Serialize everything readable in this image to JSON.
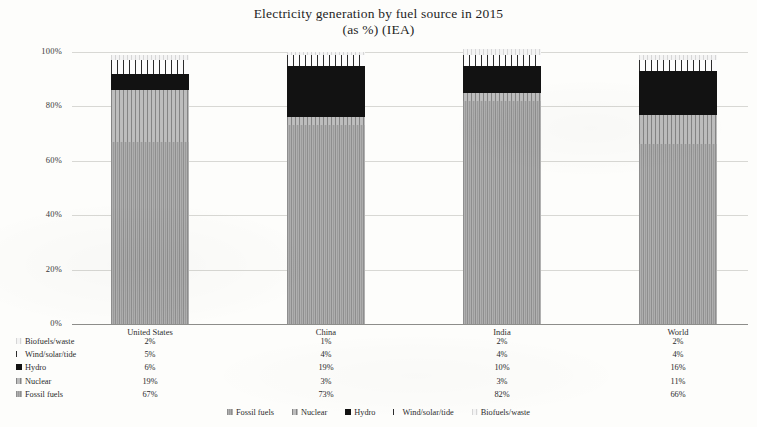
{
  "title": {
    "line1": "Electricity generation by fuel source in 2015",
    "line2": "(as %) (IEA)"
  },
  "chart_data": {
    "type": "bar",
    "subtype": "stacked-percentage-column",
    "title": "Electricity generation by fuel source in 2015 (as %) (IEA)",
    "xlabel": "",
    "ylabel": "",
    "ylim": [
      0,
      100
    ],
    "yticks": [
      "0%",
      "20%",
      "40%",
      "60%",
      "80%",
      "100%"
    ],
    "ytick_values": [
      0,
      20,
      40,
      60,
      80,
      100
    ],
    "grid": true,
    "legend_position": "bottom",
    "categories": [
      "United States",
      "China",
      "India",
      "World"
    ],
    "series": [
      {
        "name": "Fossil fuels",
        "values": [
          67,
          73,
          82,
          66
        ],
        "color": "#a3a3a3",
        "pattern": "noise"
      },
      {
        "name": "Nuclear",
        "values": [
          19,
          3,
          3,
          11
        ],
        "color": "#b5b5b5",
        "pattern": "vlines-gray"
      },
      {
        "name": "Hydro",
        "values": [
          6,
          19,
          10,
          16
        ],
        "color": "#111111",
        "pattern": "solid"
      },
      {
        "name": "Wind/solar/tide",
        "values": [
          5,
          4,
          4,
          4
        ],
        "color": "#ffffff",
        "pattern": "vlines-white"
      },
      {
        "name": "Biofuels/waste",
        "values": [
          2,
          1,
          2,
          2
        ],
        "color": "#f0f0f0",
        "pattern": "speckle"
      }
    ],
    "table": {
      "row_order": [
        "Biofuels/waste",
        "Wind/solar/tide",
        "Hydro",
        "Nuclear",
        "Fossil fuels"
      ],
      "columns": [
        "United States",
        "China",
        "India",
        "World"
      ],
      "rows": [
        {
          "label": "Biofuels/waste",
          "cells": [
            "2%",
            "1%",
            "2%",
            "2%"
          ]
        },
        {
          "label": "Wind/solar/tide",
          "cells": [
            "5%",
            "4%",
            "4%",
            "4%"
          ]
        },
        {
          "label": "Hydro",
          "cells": [
            "6%",
            "19%",
            "10%",
            "16%"
          ]
        },
        {
          "label": "Nuclear",
          "cells": [
            "19%",
            "3%",
            "3%",
            "11%"
          ]
        },
        {
          "label": "Fossil fuels",
          "cells": [
            "67%",
            "73%",
            "82%",
            "66%"
          ]
        }
      ]
    },
    "legend": [
      "Fossil fuels",
      "Nuclear",
      "Hydro",
      "Wind/solar/tide",
      "Biofuels/waste"
    ]
  }
}
